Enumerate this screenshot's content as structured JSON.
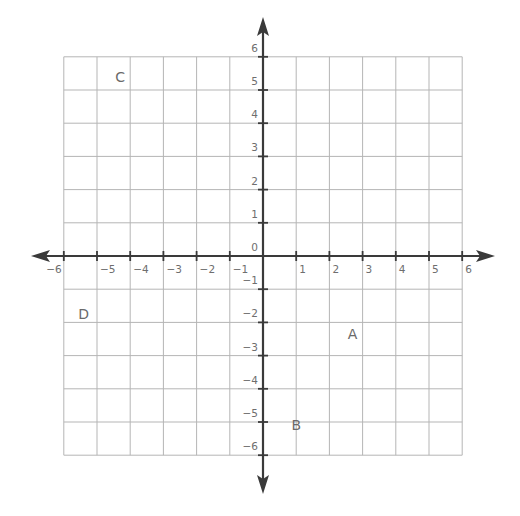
{
  "diagram": {
    "type": "coordinate-plane",
    "x_range": [
      -6,
      6
    ],
    "y_range": [
      -6,
      6
    ],
    "x_tick_labels": [
      "−6",
      "−5",
      "−4",
      "−3",
      "−2",
      "−1",
      "1",
      "2",
      "3",
      "4",
      "5",
      "6"
    ],
    "y_tick_labels": [
      "6",
      "5",
      "4",
      "3",
      "2",
      "1",
      "0",
      "−1",
      "−2",
      "−3",
      "−4",
      "−5",
      "−6"
    ],
    "points": [
      {
        "label": "A",
        "x": 2.7,
        "y": -2.35
      },
      {
        "label": "B",
        "x": 1.0,
        "y": -5.1
      },
      {
        "label": "C",
        "x": -4.3,
        "y": 5.4
      },
      {
        "label": "D",
        "x": -5.4,
        "y": -1.75
      }
    ],
    "colors": {
      "background": "#ffffff",
      "grid": "#b5b5b5",
      "axis": "#3a3a3a",
      "tick_label": "#6e6e6e",
      "point_label": "#6a6a6a"
    }
  }
}
